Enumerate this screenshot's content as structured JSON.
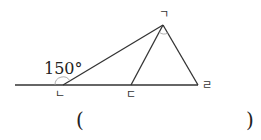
{
  "diagram": {
    "points": {
      "A": {
        "label": "ㄱ",
        "x": 163,
        "y": 25
      },
      "B": {
        "label": "ㄴ",
        "x": 63,
        "y": 85
      },
      "C": {
        "label": "ㄷ",
        "x": 131,
        "y": 85
      },
      "D": {
        "label": "ㄹ",
        "x": 198,
        "y": 85
      }
    },
    "angle_label": "150°",
    "answer_open": "(",
    "answer_close": ")",
    "colors": {
      "line": "#333333",
      "arc": "#999999"
    }
  }
}
